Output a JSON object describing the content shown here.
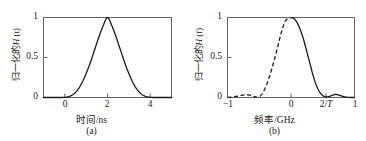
{
  "figure": {
    "width": 366,
    "height": 141,
    "background": "#ffffff",
    "axis_color": "#555555",
    "curve_color": "#1a1a1a"
  },
  "panels": [
    {
      "id": "a",
      "caption": "(a)",
      "ylabel_prefix": "归一化的",
      "ylabel_symbol": "H",
      "ylabel_arg": "(t)",
      "ylabel_full": "归一化的H (t)",
      "xlabel": "时间/ns",
      "ytick_labels": [
        "0",
        "0.5",
        "1"
      ],
      "ytick_values": [
        0,
        0.5,
        1
      ],
      "xtick_labels": [
        "0",
        "2",
        "4"
      ],
      "xtick_values": [
        0,
        2,
        4
      ]
    },
    {
      "id": "b",
      "caption": "(b)",
      "ylabel_prefix": "归一化的",
      "ylabel_symbol": "H",
      "ylabel_arg": "(f)",
      "ylabel_full": "归一化的H (f)",
      "xlabel": "频率/GHz",
      "ytick_labels": [
        "0",
        "0.5",
        "1"
      ],
      "ytick_values": [
        0,
        0.5,
        1
      ],
      "xtick_labels": [
        "−1",
        "0",
        "2/T",
        "1"
      ],
      "xtick_values": [
        -1,
        0,
        0.55,
        1
      ]
    }
  ],
  "chart_data": [
    {
      "type": "line",
      "panel": "a",
      "title": "",
      "xlabel": "时间/ns",
      "ylabel": "归一化的H (t)",
      "xlim": [
        -1,
        5
      ],
      "ylim": [
        0,
        1
      ],
      "grid": false,
      "legend": null,
      "annotations": [
        "(a)"
      ],
      "series": [
        {
          "name": "normalized pulse |h(t)|",
          "style": "solid",
          "x": [
            -1.0,
            -0.8,
            -0.6,
            -0.4,
            -0.2,
            0.0,
            0.2,
            0.4,
            0.6,
            0.8,
            1.0,
            1.2,
            1.4,
            1.6,
            1.8,
            2.0,
            2.2,
            2.4,
            2.6,
            2.8,
            3.0,
            3.2,
            3.4,
            3.6,
            3.8,
            4.0,
            4.2,
            4.4,
            4.6,
            4.8,
            5.0
          ],
          "y": [
            0.0,
            0.0,
            0.0,
            0.0,
            0.0,
            0.002,
            0.012,
            0.041,
            0.095,
            0.182,
            0.3,
            0.44,
            0.6,
            0.76,
            0.9,
            1.0,
            0.9,
            0.76,
            0.6,
            0.44,
            0.3,
            0.182,
            0.095,
            0.041,
            0.012,
            0.002,
            0.0,
            0.0,
            0.0,
            0.0,
            0.0
          ]
        }
      ]
    },
    {
      "type": "line",
      "panel": "b",
      "title": "",
      "xlabel": "频率/GHz",
      "ylabel": "归一化的H (f)",
      "xlim": [
        -1,
        1
      ],
      "ylim": [
        0,
        1
      ],
      "grid": false,
      "legend": null,
      "annotations": [
        "(b)"
      ],
      "series": [
        {
          "name": "normalized spectrum |H(f)| rising edge",
          "style": "dashed",
          "x": [
            -1.0,
            -0.94,
            -0.88,
            -0.82,
            -0.76,
            -0.7,
            -0.64,
            -0.58,
            -0.52,
            -0.46,
            -0.4,
            -0.34,
            -0.28,
            -0.22,
            -0.16,
            -0.1,
            -0.05,
            0.0
          ],
          "y": [
            0.0,
            0.005,
            0.012,
            0.02,
            0.03,
            0.035,
            0.028,
            0.012,
            0.005,
            0.04,
            0.13,
            0.26,
            0.42,
            0.6,
            0.79,
            0.94,
            0.985,
            1.0
          ]
        },
        {
          "name": "normalized spectrum |H(f)| falling edge",
          "style": "solid",
          "x": [
            0.0,
            0.05,
            0.1,
            0.15,
            0.2,
            0.25,
            0.3,
            0.35,
            0.4,
            0.45,
            0.5,
            0.55,
            0.6,
            0.65,
            0.7,
            0.75,
            0.8,
            0.85,
            0.9,
            0.95,
            1.0
          ],
          "y": [
            1.0,
            0.985,
            0.93,
            0.84,
            0.72,
            0.57,
            0.42,
            0.27,
            0.15,
            0.07,
            0.025,
            0.008,
            0.012,
            0.028,
            0.038,
            0.032,
            0.018,
            0.007,
            0.002,
            0.0,
            0.0
          ]
        }
      ]
    }
  ]
}
